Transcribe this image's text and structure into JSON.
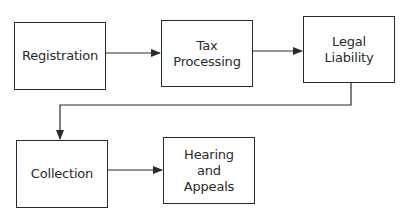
{
  "diagram": {
    "type": "flowchart",
    "nodes": [
      {
        "id": "registration",
        "label": "Registration"
      },
      {
        "id": "tax_processing",
        "label": "Tax\nProcessing"
      },
      {
        "id": "legal_liability",
        "label": "Legal\nLiability"
      },
      {
        "id": "collection",
        "label": "Collection"
      },
      {
        "id": "hearing_appeals",
        "label": "Hearing\nand\nAppeals"
      }
    ],
    "edges": [
      {
        "from": "registration",
        "to": "tax_processing"
      },
      {
        "from": "tax_processing",
        "to": "legal_liability"
      },
      {
        "from": "legal_liability",
        "to": "collection"
      },
      {
        "from": "collection",
        "to": "hearing_appeals"
      }
    ],
    "colors": {
      "stroke": "#2a2a2a",
      "background": "#ffffff"
    }
  }
}
